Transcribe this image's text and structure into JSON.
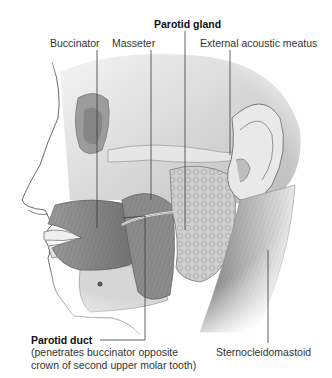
{
  "figure": {
    "labels": {
      "parotid_gland": "Parotid gland",
      "buccinator": "Buccinator",
      "masseter": "Masseter",
      "external_acoustic_meatus": "External acoustic meatus",
      "parotid_duct": "Parotid duct",
      "parotid_duct_note_line1": "(penetrates buccinator opposite",
      "parotid_duct_note_line2": "crown of second upper molar tooth)",
      "sternocleidomastoid": "Sternocleidomastoid"
    },
    "colors": {
      "background": "#ffffff",
      "leader_line": "#3a3a3a",
      "muscle": "#8f8f8f",
      "bone": "#d9d9d9",
      "gland": "#c4c4c4",
      "skin_outline": "#6a6a6a"
    }
  }
}
